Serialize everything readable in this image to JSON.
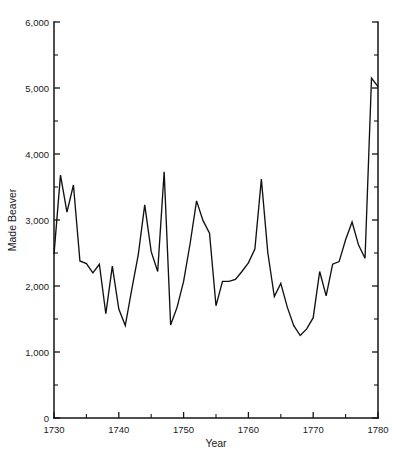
{
  "chart_data": {
    "type": "line",
    "title": "",
    "subtitle": "",
    "xlabel": "Year",
    "ylabel": "Made Beaver",
    "xlim": [
      1730,
      1780
    ],
    "ylim": [
      0,
      6000
    ],
    "grid": false,
    "legend": null,
    "x_major_ticks": [
      1730,
      1740,
      1750,
      1760,
      1770,
      1780
    ],
    "x_major_tick_labels": [
      "1730",
      "1740",
      "1750",
      "1760",
      "1770",
      "1780"
    ],
    "x_minor_ticks": [
      1735,
      1745,
      1755,
      1765,
      1775
    ],
    "y_major_ticks": [
      0,
      1000,
      2000,
      3000,
      4000,
      5000,
      6000
    ],
    "y_major_tick_labels": [
      "0",
      "1,000",
      "2,000",
      "3,000",
      "4,000",
      "5,000",
      "6,000"
    ],
    "y_minor_ticks": [
      500,
      1500,
      2500,
      3500,
      4500,
      5500
    ],
    "series": [
      {
        "name": "Made Beaver",
        "x": [
          1730,
          1731,
          1732,
          1733,
          1734,
          1735,
          1736,
          1737,
          1738,
          1739,
          1740,
          1741,
          1742,
          1743,
          1744,
          1745,
          1746,
          1747,
          1748,
          1749,
          1750,
          1751,
          1752,
          1753,
          1754,
          1755,
          1756,
          1757,
          1758,
          1759,
          1760,
          1761,
          1762,
          1763,
          1764,
          1765,
          1766,
          1767,
          1768,
          1769,
          1770,
          1771,
          1772,
          1773,
          1774,
          1775,
          1776,
          1777,
          1778,
          1779,
          1780
        ],
        "values": [
          2480,
          3680,
          3120,
          3530,
          2380,
          2340,
          2200,
          2330,
          1580,
          2300,
          1650,
          1400,
          1950,
          2470,
          3230,
          2520,
          2220,
          3730,
          1410,
          1680,
          2070,
          2640,
          3290,
          2990,
          2800,
          1700,
          2070,
          2070,
          2100,
          2220,
          2350,
          2560,
          3620,
          2500,
          1840,
          2040,
          1680,
          1400,
          1250,
          1350,
          1520,
          2220,
          1850,
          2330,
          2370,
          2700,
          2970,
          2620,
          2420,
          5150,
          5020
        ]
      }
    ]
  },
  "axis_labels": {
    "x_title": "Year",
    "y_title": "Made Beaver"
  }
}
